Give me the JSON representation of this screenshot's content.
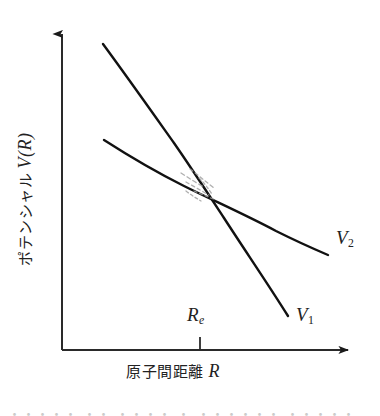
{
  "figure": {
    "kind": "potential-energy-curve-crossing-diagram",
    "background_color": "#ffffff",
    "ink_color": "#1a1a1a",
    "dashed_color": "#9a9a9a"
  },
  "axes": {
    "y_label_jp": "ポテンシャル",
    "y_label_symbol": "V(R)",
    "x_label_jp": "原子間距離",
    "x_label_symbol": "R",
    "origin": [
      62,
      350
    ],
    "y_axis_top": [
      62,
      28
    ],
    "x_axis_right": [
      356,
      350
    ],
    "arrowheads": true,
    "ticks": [
      {
        "name": "Re",
        "x": 200,
        "label": "R",
        "sub": "e"
      }
    ]
  },
  "curves": [
    {
      "name": "V1",
      "label": "V",
      "sub": "1",
      "description": "steeper repulsive diabatic curve, upper-left to lower-right",
      "points": [
        [
          103,
          44
        ],
        [
          140,
          95
        ],
        [
          172,
          140
        ],
        [
          196,
          175
        ],
        [
          222,
          215
        ],
        [
          252,
          262
        ],
        [
          288,
          316
        ]
      ]
    },
    {
      "name": "V2",
      "label": "V",
      "sub": "2",
      "description": "shallower diabatic curve, crosses V1 near Re",
      "points": [
        [
          104,
          140
        ],
        [
          140,
          163
        ],
        [
          172,
          180
        ],
        [
          200,
          193
        ],
        [
          232,
          209
        ],
        [
          270,
          228
        ],
        [
          300,
          242
        ],
        [
          328,
          255
        ]
      ]
    }
  ],
  "annotations": {
    "avoided_crossing": {
      "description": "faint hand-drawn dashed arcs sketched inside the crossing region",
      "center": [
        201,
        186
      ],
      "color": "#9e9e9e"
    }
  },
  "labels": {
    "re": "R",
    "re_sub": "e",
    "v1": "V",
    "v1_sub": "1",
    "v2": "V",
    "v2_sub": "2"
  },
  "caption": {
    "text": "・・・・・  ・・  ・・・・ ・  ・・・・・・ ・・・・・"
  }
}
